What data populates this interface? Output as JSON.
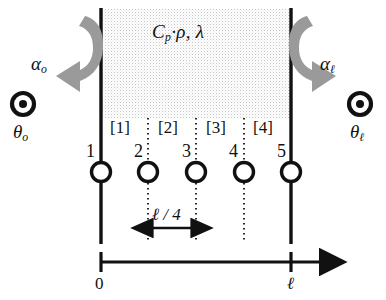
{
  "diagram": {
    "material_label": {
      "symbol_cp": "C",
      "symbol_cp_sub": "p",
      "separator_dot": "·",
      "symbol_rho": "ρ",
      "comma": ",",
      "symbol_lambda": "λ",
      "full_text": "Cₚ·ρ, λ"
    },
    "left_boundary": {
      "alpha_symbol": "α",
      "alpha_subscript": "o",
      "theta_symbol": "θ",
      "theta_subscript": "o",
      "marker_icon": "bullseye-icon"
    },
    "right_boundary": {
      "alpha_symbol": "α",
      "alpha_subscript": "ℓ",
      "theta_symbol": "θ",
      "theta_subscript": "ℓ",
      "marker_icon": "bullseye-icon"
    },
    "nodes": [
      {
        "label": "1",
        "x": 101
      },
      {
        "label": "2",
        "x": 148
      },
      {
        "label": "3",
        "x": 196
      },
      {
        "label": "4",
        "x": 244
      },
      {
        "label": "5",
        "x": 291
      }
    ],
    "elements": [
      {
        "label": "[1]",
        "center_x": 124
      },
      {
        "label": "[2]",
        "center_x": 172
      },
      {
        "label": "[3]",
        "center_x": 220
      },
      {
        "label": "[4]",
        "center_x": 267
      }
    ],
    "dimension": {
      "label": "ℓ / 4",
      "from_x": 148,
      "to_x": 196
    },
    "axis": {
      "start_label": "0",
      "end_label": "ℓ",
      "start_x": 101,
      "end_x": 291,
      "arrow_tip_x": 325,
      "y": 262
    },
    "colors": {
      "line": "#111111",
      "arrow_gray": "#9a9a9a",
      "stipple": "#c8c8c8",
      "background": "#ffffff"
    }
  }
}
